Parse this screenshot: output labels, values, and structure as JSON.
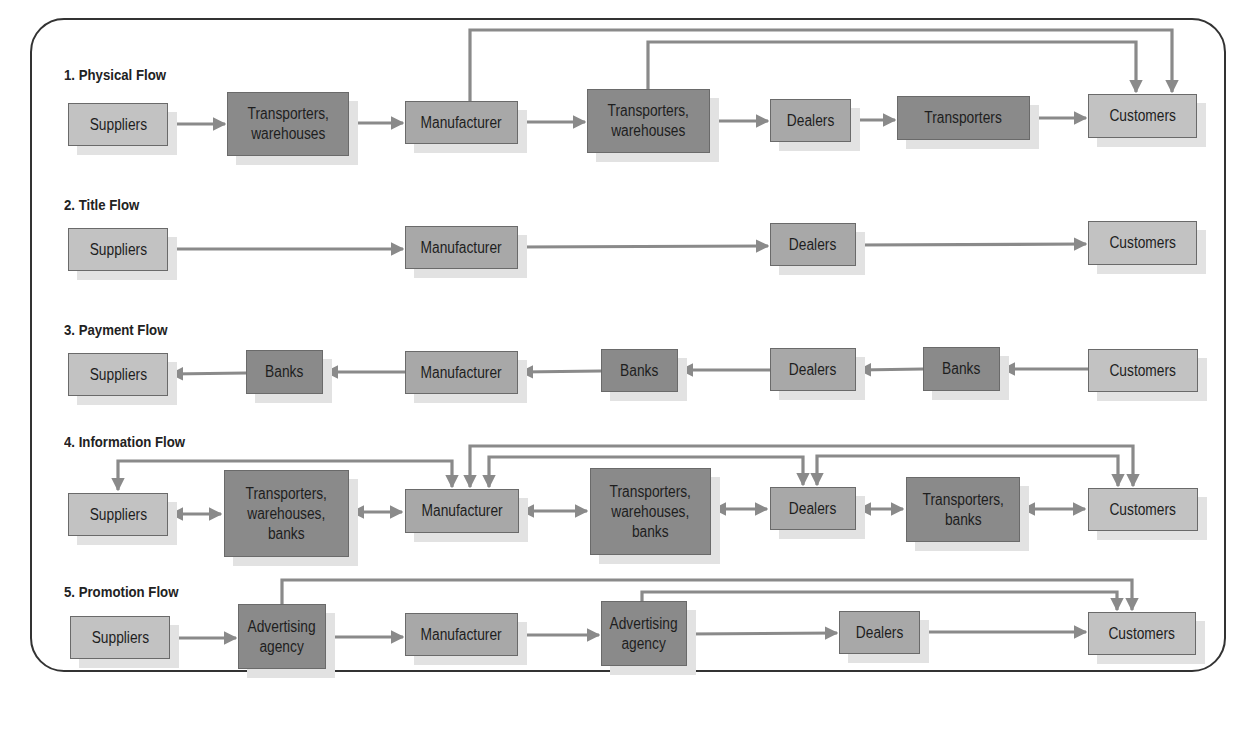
{
  "colors": {
    "frame_border": "#333333",
    "box_light": "#c2c2c2",
    "box_mid": "#a8a8a8",
    "box_dark": "#8a8a8a",
    "arrow": "#8a8a8a",
    "shadow": "#e2e2e2"
  },
  "flows": [
    {
      "title": "1. Physical Flow",
      "nodes": [
        "Suppliers",
        "Transporters,\nwarehouses",
        "Manufacturer",
        "Transporters,\nwarehouses",
        "Dealers",
        "Transporters",
        "Customers"
      ],
      "direction": "forward",
      "bypass": [
        "Manufacturer → Customers",
        "Transporters, warehouses → Customers"
      ]
    },
    {
      "title": "2. Title Flow",
      "nodes": [
        "Suppliers",
        "Manufacturer",
        "Dealers",
        "Customers"
      ],
      "direction": "forward"
    },
    {
      "title": "3. Payment Flow",
      "nodes": [
        "Suppliers",
        "Banks",
        "Manufacturer",
        "Banks",
        "Dealers",
        "Banks",
        "Customers"
      ],
      "direction": "backward"
    },
    {
      "title": "4. Information Flow",
      "nodes": [
        "Suppliers",
        "Transporters,\nwarehouses,\nbanks",
        "Manufacturer",
        "Transporters,\nwarehouses,\nbanks",
        "Dealers",
        "Transporters,\nbanks",
        "Customers"
      ],
      "direction": "bidirectional",
      "bypass": [
        "Suppliers ↔ Manufacturer",
        "Manufacturer ↔ Customers",
        "Manufacturer ↔ Dealers",
        "Dealers ↔ Customers"
      ]
    },
    {
      "title": "5. Promotion Flow",
      "nodes": [
        "Suppliers",
        "Advertising\nagency",
        "Manufacturer",
        "Advertising\nagency",
        "Dealers",
        "Customers"
      ],
      "direction": "forward",
      "bypass": [
        "Advertising agency → Customers",
        "Advertising agency → Customers"
      ]
    }
  ]
}
